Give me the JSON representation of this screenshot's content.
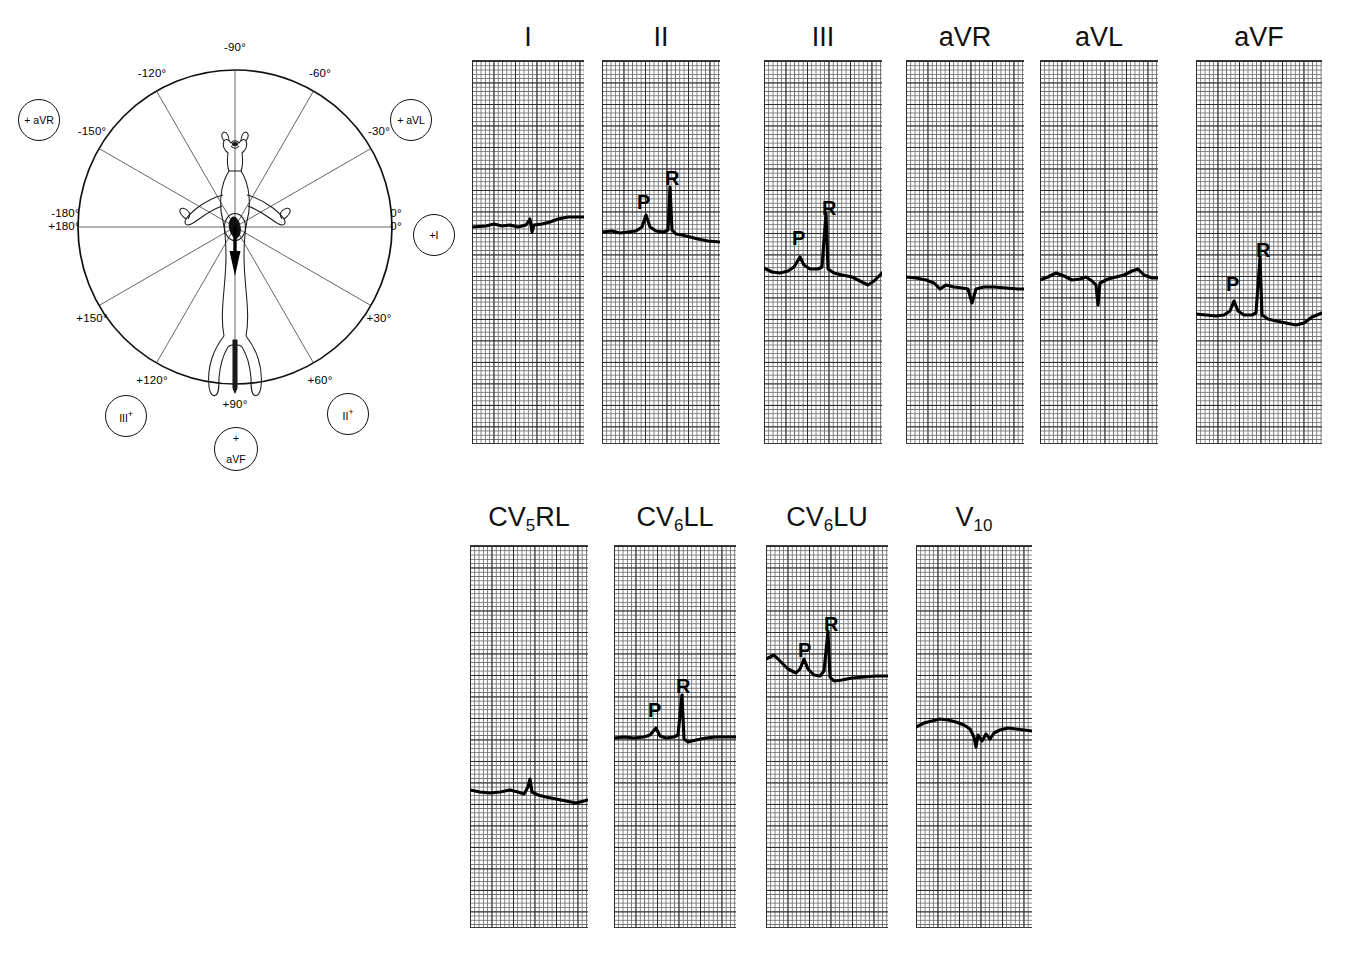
{
  "figure": {
    "type": "canine-ecg-figure",
    "background": "#ffffff",
    "ink": "#000000"
  },
  "axis_diagram": {
    "name": "hexaxial-reference-system",
    "center": {
      "x": 235,
      "y": 227
    },
    "radius": 157,
    "subject": "dog-ventral-silhouette",
    "mean_axis_arrow": {
      "direction_deg": 90,
      "label": "mean electrical axis"
    },
    "degree_labels": [
      {
        "text": "-90°",
        "deg": -90,
        "x": 235,
        "y": 47,
        "anchor": "center"
      },
      {
        "text": "-120°",
        "deg": -120,
        "x": 152,
        "y": 73,
        "anchor": "center"
      },
      {
        "text": "-60°",
        "deg": -60,
        "x": 320,
        "y": 73,
        "anchor": "center"
      },
      {
        "text": "-150°",
        "deg": -150,
        "x": 92,
        "y": 131,
        "anchor": "center"
      },
      {
        "text": "-30°",
        "deg": -30,
        "x": 379,
        "y": 131,
        "anchor": "center"
      },
      {
        "text": "+150°",
        "deg": 150,
        "x": 92,
        "y": 318,
        "anchor": "center"
      },
      {
        "text": "+30°",
        "deg": 30,
        "x": 379,
        "y": 318,
        "anchor": "center"
      },
      {
        "text": "+120°",
        "deg": 120,
        "x": 152,
        "y": 380,
        "anchor": "center"
      },
      {
        "text": "+60°",
        "deg": 60,
        "x": 320,
        "y": 380,
        "anchor": "center"
      },
      {
        "text": "+90°",
        "deg": 90,
        "x": 235,
        "y": 404,
        "anchor": "center"
      }
    ],
    "left_axis_label": {
      "line1": "-180°",
      "line2": "+180°",
      "x": 64,
      "y": 220
    },
    "right_axis_label": {
      "line1": "0°",
      "line2": "0°",
      "x": 396,
      "y": 220
    },
    "spokes_deg": [
      0,
      30,
      60,
      90,
      120,
      150
    ],
    "lead_badges": [
      {
        "id": "badge-avr",
        "label": "+ aVR",
        "kind": "inline",
        "cx": 39,
        "cy": 120,
        "r": 21
      },
      {
        "id": "badge-avl",
        "label": "+ aVL",
        "kind": "inline",
        "cx": 411,
        "cy": 120,
        "r": 21
      },
      {
        "id": "badge-i",
        "label": "+I",
        "kind": "inline",
        "cx": 434,
        "cy": 235,
        "r": 21
      },
      {
        "id": "badge-iii",
        "label": "III",
        "kind": "sup-plus",
        "plus": "+",
        "cx": 126,
        "cy": 416,
        "r": 21
      },
      {
        "id": "badge-ii",
        "label": "II",
        "kind": "sup-plus",
        "plus": "+",
        "cx": 348,
        "cy": 414,
        "r": 21
      },
      {
        "id": "badge-avf",
        "label": "aVF",
        "kind": "stacked-plus",
        "plus": "+",
        "cx": 236,
        "cy": 449,
        "r": 22
      }
    ]
  },
  "ecg": {
    "grid": {
      "small_px": 4.3,
      "bold_every": 5,
      "fine_color": "#6f6f6f",
      "bold_color": "#2b2b2b",
      "trace_color": "#000000"
    },
    "rows": [
      {
        "row": "limb-leads",
        "label_y": 22,
        "strip_top": 60,
        "strip_height": 384,
        "strips": [
          {
            "lead": "I",
            "label": "I",
            "sub": "",
            "x": 472,
            "width": 112,
            "baseline": 225,
            "annotations": [],
            "wave": "flat-isoelectric-small-notch",
            "path": "M0,226 L14,225 L22,223 L30,225 L38,224 L46,226 L54,224 L58,218 L60,231 L62,224 L70,223 L78,221 L86,218 L96,216 L106,216 L112,216"
          },
          {
            "lead": "II",
            "label": "II",
            "sub": "",
            "x": 602,
            "width": 118,
            "baseline": 230,
            "annotations": [
              {
                "text": "P",
                "x": 35,
                "y": 192
              },
              {
                "text": "R",
                "x": 63,
                "y": 168
              }
            ],
            "wave": "positive-P-and-tall-R",
            "path": "M0,231 L10,230 L18,232 L26,231 L34,230 L40,226 L44,214 L48,226 L54,230 L62,231 L66,229 L68,186 L70,229 L74,233 L80,234 L88,236 L96,238 L106,240 L118,241"
          },
          {
            "lead": "III",
            "label": "III",
            "sub": "",
            "x": 764,
            "width": 118,
            "baseline": 265,
            "annotations": [
              {
                "text": "P",
                "x": 28,
                "y": 228
              },
              {
                "text": "R",
                "x": 58,
                "y": 198
              }
            ],
            "wave": "positive-P-and-tall-R-with-dip",
            "path": "M0,267 L8,271 L16,272 L24,270 L30,266 L36,256 L40,264 L46,268 L54,268 L58,266 L62,212 L64,268 L70,272 L78,274 L88,276 L96,280 L104,284 L110,280 L118,272"
          },
          {
            "lead": "aVR",
            "label": "aVR",
            "sub": "",
            "x": 906,
            "width": 118,
            "baseline": 277,
            "annotations": [],
            "wave": "negative-deflection",
            "path": "M0,276 L10,277 L20,279 L28,282 L34,288 L40,284 L48,286 L56,287 L62,288 L66,302 L70,288 L78,286 L88,286 L100,287 L112,288 L118,288"
          },
          {
            "lead": "aVL",
            "label": "aVL",
            "sub": "",
            "x": 1040,
            "width": 118,
            "baseline": 276,
            "annotations": [],
            "wave": "sharp-negative-spike",
            "path": "M0,279 L8,276 L16,272 L24,275 L32,279 L40,278 L46,276 L52,280 L56,284 L58,304 L60,282 L68,278 L76,276 L84,274 L92,270 L98,268 L104,274 L112,277 L118,277"
          },
          {
            "lead": "aVF",
            "label": "aVF",
            "sub": "",
            "x": 1196,
            "width": 126,
            "baseline": 311,
            "annotations": [
              {
                "text": "P",
                "x": 30,
                "y": 274
              },
              {
                "text": "R",
                "x": 60,
                "y": 240
              }
            ],
            "wave": "positive-P-and-tall-R",
            "path": "M0,313 L10,314 L20,315 L28,314 L34,310 L38,300 L42,310 L48,314 L56,314 L60,312 L64,256 L66,314 L72,318 L80,320 L90,322 L100,324 L108,322 L116,316 L126,312"
          }
        ]
      },
      {
        "row": "chest-leads",
        "label_y": 502,
        "strip_top": 545,
        "strip_height": 383,
        "strips": [
          {
            "lead": "CV5RL",
            "label": "CV",
            "sub": "5",
            "label_tail": "RL",
            "x": 470,
            "width": 118,
            "baseline": 790,
            "annotations": [],
            "wave": "flat-with-small-spike",
            "path": "M0,789 L10,791 L20,792 L30,791 L40,789 L48,791 L54,793 L58,786 L60,778 L62,791 L68,794 L76,796 L86,798 L96,800 L106,802 L114,800 L118,799"
          },
          {
            "lead": "CV6LL",
            "label": "CV",
            "sub": "6",
            "label_tail": "LL",
            "x": 614,
            "width": 122,
            "baseline": 736,
            "annotations": [
              {
                "text": "P",
                "x": 34,
                "y": 700
              },
              {
                "text": "R",
                "x": 62,
                "y": 676
              }
            ],
            "wave": "positive-P-and-R",
            "path": "M0,737 L10,736 L20,737 L30,736 L36,734 L42,727 L46,735 L52,737 L60,736 L64,734 L68,694 L70,738 L74,741 L82,739 L92,737 L102,736 L112,736 L122,736"
          },
          {
            "lead": "CV6LU",
            "label": "CV",
            "sub": "6",
            "label_tail": "LU",
            "x": 766,
            "width": 122,
            "baseline": 672,
            "annotations": [
              {
                "text": "P",
                "x": 32,
                "y": 640
              },
              {
                "text": "R",
                "x": 58,
                "y": 614
              }
            ],
            "wave": "positive-P-and-R-high",
            "path": "M0,658 L8,654 L14,660 L22,668 L30,672 L34,668 L38,658 L42,668 L48,674 L54,675 L58,670 L62,630 L64,676 L68,680 L76,679 L86,677 L98,676 L110,675 L122,675"
          },
          {
            "lead": "V10",
            "label": "V",
            "sub": "10",
            "label_tail": "",
            "x": 916,
            "width": 116,
            "baseline": 724,
            "annotations": [],
            "wave": "noisy-negative",
            "path": "M0,726 L8,722 L16,720 L24,718 L32,719 L40,721 L48,724 L54,728 L58,736 L60,746 L62,734 L66,740 L70,733 L74,738 L78,732 L84,729 L92,727 L100,728 L108,729 L116,730"
          }
        ]
      }
    ]
  }
}
